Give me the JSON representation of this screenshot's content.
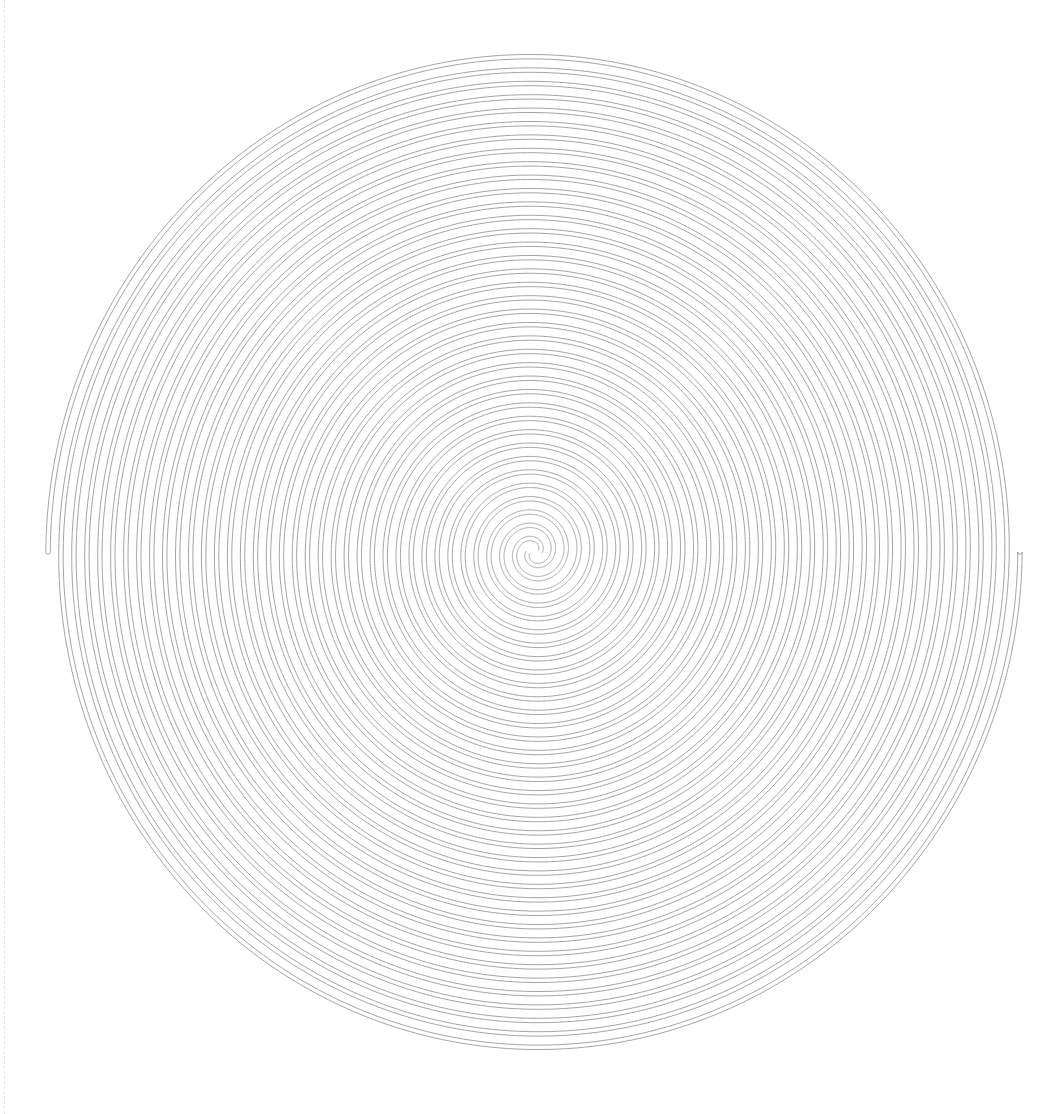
{
  "figure": {
    "title": "",
    "background": "#ffffff",
    "guide_color": "#e6e6e6",
    "spiral": {
      "type": "double-spiral-tube",
      "center": [
        534,
        552
      ],
      "outer_radius_x": 486,
      "outer_radius_y": 502,
      "inner_radius": 6,
      "turns": 18.5,
      "arms": 2,
      "tube_half_width": 2.2,
      "stroke_color": "#9a9a9a",
      "stroke_width": 0.9,
      "start_angle_deg": 180
    }
  }
}
